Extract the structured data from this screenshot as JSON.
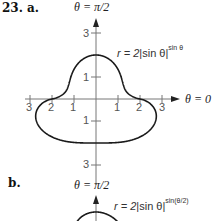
{
  "problem_number": "23.",
  "parts": [
    {
      "label": "a.",
      "axis_top_label": "θ = π/2",
      "axis_right_label": "θ = 0",
      "equation": {
        "lhs": "r = 2",
        "base": "sin θ",
        "exponent": "sin θ"
      },
      "x_ticks": [
        "3",
        "2",
        "1",
        "1",
        "2",
        "3"
      ],
      "y_ticks": [
        "3",
        "1",
        "1",
        "3"
      ],
      "curve": {
        "formula": "r = 2|sin θ|^(sin θ)",
        "exponent_factor": 1
      }
    },
    {
      "label": "b.",
      "axis_top_label": "θ = π/2",
      "equation": {
        "lhs": "r = 2",
        "base": "sin θ",
        "exponent": "sin(θ/2)"
      },
      "curve": {
        "formula": "r = 2|sin θ|^(sin(θ/2))",
        "exponent_factor": 0.5
      }
    }
  ],
  "colors": {
    "curve": "#1a1a1a",
    "axis": "#777777"
  }
}
